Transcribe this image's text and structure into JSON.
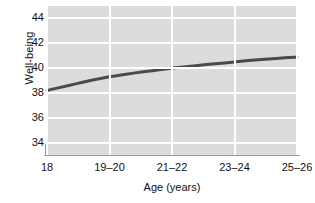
{
  "chart_data": {
    "type": "line",
    "title": "",
    "xlabel": "Age (years)",
    "ylabel": "Well-being",
    "categories": [
      "18",
      "19–20",
      "21–22",
      "23–24",
      "25–26"
    ],
    "series": [
      {
        "name": "Well-being",
        "values": [
          38.2,
          39.3,
          40.0,
          40.5,
          40.9
        ],
        "color": "#4a4a4a"
      }
    ],
    "yticks": [
      34,
      36,
      38,
      40,
      42,
      44
    ],
    "ytick_labels": [
      "34",
      "36",
      "38",
      "40",
      "42",
      "44"
    ],
    "ylim": [
      33.0,
      45.0
    ],
    "xlim": [
      0,
      4
    ],
    "grid": "both",
    "legend": "none",
    "plot_background": "#dcdcdc",
    "grid_color": "#ffffff",
    "axis_color": "#9a9a9a",
    "line_color": "#4a4a4a",
    "line_width": 3
  }
}
